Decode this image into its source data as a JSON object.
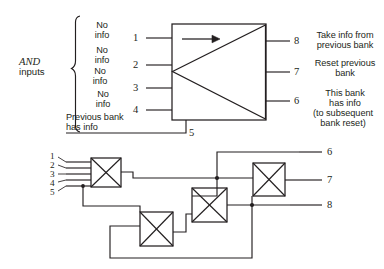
{
  "figure": {
    "background_color": "#ffffff",
    "ink_color": "#231f20",
    "top_block": {
      "group_label_emphasis": "AND",
      "group_label_rest": "inputs",
      "input_annotations": [
        {
          "line1": "No",
          "line2": "info"
        },
        {
          "line1": "No",
          "line2": "info"
        },
        {
          "line1": "No",
          "line2": "info"
        },
        {
          "line1": "No",
          "line2": "info"
        }
      ],
      "bottom_input_annotation": {
        "line1": "Previous bank",
        "line2": "has info"
      },
      "input_pins": [
        "1",
        "2",
        "3",
        "4"
      ],
      "bottom_pin": "5",
      "output_pins": [
        "8",
        "7",
        "6"
      ],
      "output_annotations": [
        {
          "lines": [
            "Take info from",
            "previous bank"
          ]
        },
        {
          "lines": [
            "Reset previous",
            "bank"
          ]
        },
        {
          "lines": [
            "This bank",
            "has info",
            "(to subsequent",
            "bank reset)"
          ]
        }
      ]
    },
    "bottom_block": {
      "input_pins": [
        "1",
        "2",
        "3",
        "4",
        "5"
      ],
      "output_pins": [
        "6",
        "7",
        "8"
      ],
      "gate_count": 4,
      "gate_symbol": "crossed-box"
    }
  }
}
